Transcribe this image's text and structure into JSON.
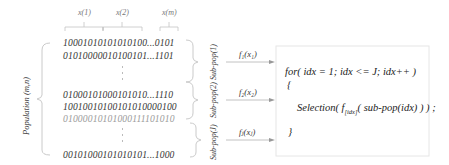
{
  "diagram": {
    "gene_labels": [
      "x(1)",
      "x(2)",
      "x(m)"
    ],
    "population_label": "Population (m,n)",
    "rows": [
      {
        "bits": "10001010101010100...0101",
        "faded": false
      },
      {
        "bits": "01010000010100101...1101",
        "faded": false
      },
      {
        "bits": "01000101000101010...1110",
        "faded": false
      },
      {
        "bits": "10010010100101010000100",
        "faded": false
      },
      {
        "bits": "01000010101000111101010",
        "faded": true
      },
      {
        "bits": "00101000101010101...1000",
        "faded": false
      }
    ],
    "subpops": [
      {
        "label": "Sub-pop(1)",
        "fn": "f₁(x₁)"
      },
      {
        "label": "Sub-pop(2)",
        "fn": "f₂(x₂)"
      },
      {
        "label": "Sub-pop(J)",
        "fn": "fⱼ(xⱼ)"
      }
    ],
    "code": {
      "line1": "for( idx = 1; idx <= J; idx++ )",
      "open": "{",
      "sel_pre": "Selection( f",
      "sel_sub": "[idx]",
      "sel_post": "( sub-pop(idx) ) ) ;",
      "close": "}"
    },
    "colors": {
      "line": "#bdbdbd",
      "arrow": "#999999",
      "box": "#e6e6e6"
    }
  }
}
